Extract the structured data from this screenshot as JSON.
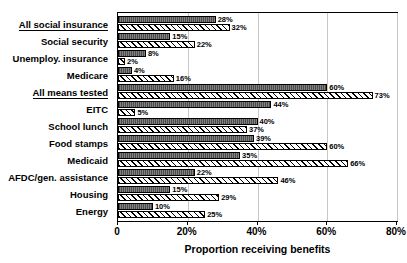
{
  "chart_data": {
    "type": "bar",
    "orientation": "horizontal",
    "title": "",
    "xlabel": "Proportion receiving benefits",
    "ylabel": "",
    "xlim": [
      0,
      80
    ],
    "xticks": [
      0,
      20,
      40,
      60,
      80
    ],
    "xtick_labels": [
      "0",
      "20%",
      "40%",
      "60%",
      "80%"
    ],
    "grid": true,
    "legend": "none",
    "categories": [
      "All social insurance",
      "Social security",
      "Unemploy. insurance",
      "Medicare",
      "All means tested",
      "EITC",
      "School lunch",
      "Food stamps",
      "Medicaid",
      "AFDC/gen. assistance",
      "Housing",
      "Energy"
    ],
    "category_is_header": [
      true,
      false,
      false,
      false,
      true,
      false,
      false,
      false,
      false,
      false,
      false,
      false
    ],
    "series": [
      {
        "name": "series-dark",
        "style": "solid-gray",
        "values": [
          28,
          15,
          8,
          4,
          60,
          44,
          40,
          39,
          35,
          22,
          15,
          10
        ],
        "labels": [
          "28%",
          "15%",
          "8%",
          "4%",
          "60%",
          "44%",
          "40%",
          "39%",
          "35%",
          "22%",
          "15%",
          "10%"
        ]
      },
      {
        "name": "series-light",
        "style": "diagonal-hatch",
        "values": [
          32,
          22,
          2,
          16,
          73,
          5,
          37,
          60,
          66,
          46,
          29,
          25
        ],
        "labels": [
          "32%",
          "22%",
          "2%",
          "16%",
          "73%",
          "5%",
          "37%",
          "60%",
          "66%",
          "46%",
          "29%",
          "25%"
        ]
      }
    ]
  }
}
